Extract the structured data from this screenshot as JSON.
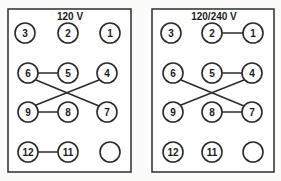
{
  "diagram": {
    "kind": "terminal-block-wiring-diagram",
    "panels": [
      {
        "id": "panel-120v",
        "title": "120 V",
        "frame": {
          "x": 8,
          "y": 9,
          "width": 123,
          "height": 163
        },
        "title_pos": {
          "x": 70,
          "y": 16
        },
        "terminals": [
          {
            "id": "t3",
            "label": "3",
            "cx": 25,
            "cy": 33,
            "r": 10
          },
          {
            "id": "t2",
            "label": "2",
            "cx": 68,
            "cy": 33,
            "r": 10
          },
          {
            "id": "t1",
            "label": "1",
            "cx": 110,
            "cy": 33,
            "r": 10
          },
          {
            "id": "t6",
            "label": "6",
            "cx": 28,
            "cy": 73,
            "r": 10
          },
          {
            "id": "t5",
            "label": "5",
            "cx": 68,
            "cy": 73,
            "r": 10
          },
          {
            "id": "t4",
            "label": "4",
            "cx": 107,
            "cy": 73,
            "r": 10
          },
          {
            "id": "t9",
            "label": "9",
            "cx": 28,
            "cy": 112,
            "r": 10
          },
          {
            "id": "t8",
            "label": "8",
            "cx": 68,
            "cy": 112,
            "r": 10
          },
          {
            "id": "t7",
            "label": "7",
            "cx": 107,
            "cy": 112,
            "r": 10
          },
          {
            "id": "t12",
            "label": "12",
            "cx": 28,
            "cy": 152,
            "r": 10
          },
          {
            "id": "t11",
            "label": "11",
            "cx": 68,
            "cy": 152,
            "r": 10
          },
          {
            "id": "tblank",
            "label": "",
            "cx": 110,
            "cy": 152,
            "r": 10
          }
        ],
        "connections": [
          {
            "id": "w-6-5",
            "from": "6",
            "to": "5",
            "x1": 38,
            "y1": 73,
            "x2": 58,
            "y2": 73
          },
          {
            "id": "w-9-8",
            "from": "9",
            "to": "8",
            "x1": 38,
            "y1": 112,
            "x2": 58,
            "y2": 112
          },
          {
            "id": "w-6-7",
            "from": "6",
            "to": "7",
            "x1": 36,
            "y1": 80,
            "x2": 99,
            "y2": 106
          },
          {
            "id": "w-9-4",
            "from": "9",
            "to": "4",
            "x1": 36,
            "y1": 105,
            "x2": 99,
            "y2": 80
          },
          {
            "id": "w-12-11",
            "from": "12",
            "to": "11",
            "x1": 38,
            "y1": 152,
            "x2": 58,
            "y2": 152
          }
        ]
      },
      {
        "id": "panel-120-240v",
        "title": "120/240 V",
        "frame": {
          "x": 152,
          "y": 9,
          "width": 122,
          "height": 163
        },
        "title_pos": {
          "x": 214,
          "y": 16
        },
        "terminals": [
          {
            "id": "t3",
            "label": "3",
            "cx": 171,
            "cy": 33,
            "r": 10
          },
          {
            "id": "t2",
            "label": "2",
            "cx": 212,
            "cy": 33,
            "r": 10
          },
          {
            "id": "t1",
            "label": "1",
            "cx": 253,
            "cy": 33,
            "r": 10
          },
          {
            "id": "t6",
            "label": "6",
            "cx": 173,
            "cy": 73,
            "r": 10
          },
          {
            "id": "t5",
            "label": "5",
            "cx": 212,
            "cy": 73,
            "r": 10
          },
          {
            "id": "t4",
            "label": "4",
            "cx": 252,
            "cy": 73,
            "r": 10
          },
          {
            "id": "t9",
            "label": "9",
            "cx": 173,
            "cy": 112,
            "r": 10
          },
          {
            "id": "t8",
            "label": "8",
            "cx": 212,
            "cy": 112,
            "r": 10
          },
          {
            "id": "t7",
            "label": "7",
            "cx": 252,
            "cy": 112,
            "r": 10
          },
          {
            "id": "t12",
            "label": "12",
            "cx": 173,
            "cy": 152,
            "r": 10
          },
          {
            "id": "t11",
            "label": "11",
            "cx": 212,
            "cy": 152,
            "r": 10
          },
          {
            "id": "tblank",
            "label": "",
            "cx": 253,
            "cy": 152,
            "r": 10
          }
        ],
        "connections": [
          {
            "id": "w-2-1",
            "from": "2",
            "to": "1",
            "x1": 222,
            "y1": 33,
            "x2": 243,
            "y2": 33
          },
          {
            "id": "w-5-4",
            "from": "5",
            "to": "4",
            "x1": 222,
            "y1": 73,
            "x2": 242,
            "y2": 73
          },
          {
            "id": "w-8-7",
            "from": "8",
            "to": "7",
            "x1": 222,
            "y1": 112,
            "x2": 242,
            "y2": 112
          },
          {
            "id": "w-6-7",
            "from": "6",
            "to": "7",
            "x1": 181,
            "y1": 80,
            "x2": 244,
            "y2": 106
          },
          {
            "id": "w-9-4",
            "from": "9",
            "to": "4",
            "x1": 181,
            "y1": 105,
            "x2": 244,
            "y2": 80
          }
        ]
      }
    ],
    "colors": {
      "stroke": "#2b2b2b",
      "frame": "#3a3a3a",
      "fill": "#ffffff",
      "background": "#fbfbfa",
      "text": "#1c1c1c"
    }
  }
}
